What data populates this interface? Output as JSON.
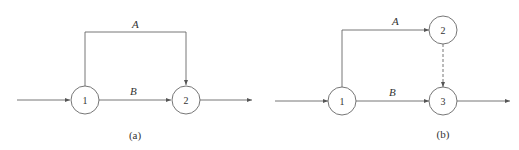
{
  "diagrams": [
    {
      "caption": "(a)",
      "nodes": [
        {
          "id": "1",
          "label": "1"
        },
        {
          "id": "2",
          "label": "2"
        }
      ],
      "edges": [
        {
          "from": "1",
          "to": "2",
          "label": "A",
          "style": "solid",
          "route": "over-top"
        },
        {
          "from": "1",
          "to": "2",
          "label": "B",
          "style": "solid",
          "route": "direct"
        }
      ]
    },
    {
      "caption": "(b)",
      "nodes": [
        {
          "id": "1",
          "label": "1"
        },
        {
          "id": "2",
          "label": "2"
        },
        {
          "id": "3",
          "label": "3"
        }
      ],
      "edges": [
        {
          "from": "1",
          "to": "2",
          "label": "A",
          "style": "solid"
        },
        {
          "from": "1",
          "to": "3",
          "label": "B",
          "style": "solid"
        },
        {
          "from": "2",
          "to": "3",
          "label": "",
          "style": "dashed"
        }
      ]
    }
  ]
}
